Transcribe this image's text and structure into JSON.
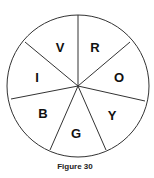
{
  "figure": {
    "caption": "Figure 30",
    "type": "circle divided into 7 sectors",
    "sectors": [
      {
        "label": "R",
        "x": 95,
        "y": 47
      },
      {
        "label": "O",
        "x": 119,
        "y": 77
      },
      {
        "label": "Y",
        "x": 112,
        "y": 115
      },
      {
        "label": "G",
        "x": 76,
        "y": 133
      },
      {
        "label": "B",
        "x": 43,
        "y": 113
      },
      {
        "label": "I",
        "x": 37,
        "y": 77
      },
      {
        "label": "V",
        "x": 60,
        "y": 47
      }
    ]
  }
}
